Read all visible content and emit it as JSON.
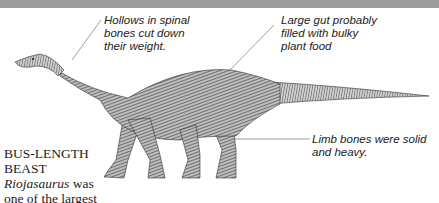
{
  "annotations": {
    "spine": "Hollows in spinal bones cut down their weight.",
    "spine_lines": [
      "Hollows in spinal",
      "bones cut down",
      "their weight."
    ],
    "gut_lines": [
      "Large gut probably",
      "filled with bulky",
      "plant food"
    ],
    "limbs_lines": [
      "Limb bones were solid",
      "and heavy."
    ]
  },
  "caption": {
    "heading": "BUS-LENGTH BEAST",
    "species": "Riojasaurus",
    "text_after_species": " was",
    "continuation": "one of the largest"
  },
  "illustration": {
    "subject": "Riojasaurus dinosaur",
    "colors": {
      "band": "#9c9c9c",
      "ink": "#333333",
      "leader": "#888888"
    }
  }
}
